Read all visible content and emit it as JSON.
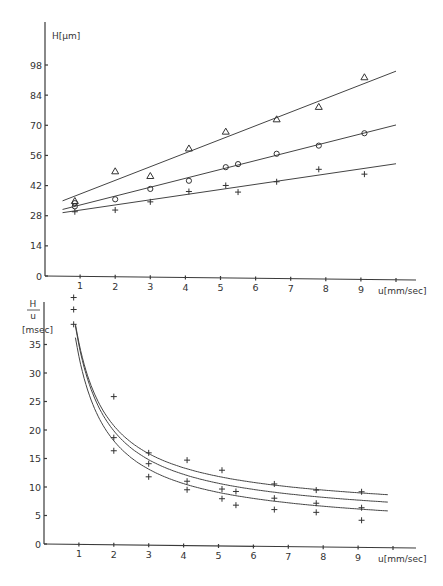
{
  "chart_data": [
    {
      "type": "scatter",
      "title": "",
      "xlabel": "u[mm/sec]",
      "ylabel": "H[µm]",
      "xlim": [
        0,
        10
      ],
      "ylim": [
        0,
        112
      ],
      "x_ticks": [
        "1",
        "2",
        "3",
        "4",
        "5",
        "6",
        "7",
        "8",
        "9"
      ],
      "y_ticks": [
        "0",
        "14",
        "28",
        "42",
        "56",
        "70",
        "84",
        "98"
      ],
      "grid": false,
      "legend": null,
      "series": [
        {
          "name": "triangle",
          "marker": "triangle",
          "x": [
            0.85,
            2.0,
            3.0,
            4.1,
            5.15,
            6.6,
            7.8,
            9.1
          ],
          "y": [
            35,
            49,
            47,
            60,
            68,
            74,
            80,
            94
          ],
          "fit_line": {
            "x": [
              0.5,
              10.0
            ],
            "y": [
              35,
              97
            ]
          }
        },
        {
          "name": "circle",
          "marker": "circle",
          "x": [
            0.85,
            0.85,
            2.0,
            3.0,
            4.1,
            5.15,
            5.5,
            6.6,
            7.8,
            9.1
          ],
          "y": [
            34,
            32.5,
            36,
            41,
            45,
            51.5,
            53,
            58,
            62,
            68
          ],
          "fit_line": {
            "x": [
              0.5,
              10.0
            ],
            "y": [
              31,
              72
            ]
          }
        },
        {
          "name": "plus",
          "marker": "plus",
          "x": [
            0.85,
            2.0,
            3.0,
            4.1,
            5.15,
            5.5,
            6.6,
            7.8,
            9.1
          ],
          "y": [
            30,
            31,
            35,
            40,
            43,
            40,
            45,
            51,
            49
          ],
          "fit_line": {
            "x": [
              0.5,
              10.0
            ],
            "y": [
              29.5,
              54
            ]
          }
        }
      ]
    },
    {
      "type": "scatter",
      "title": "",
      "xlabel": "u[mm/sec]",
      "ylabel": "H/u [msec]",
      "ylabel_numerator": "H",
      "ylabel_denominator": "u",
      "ylabel_unit": "[msec]",
      "xlim": [
        0,
        10
      ],
      "ylim": [
        0,
        40
      ],
      "x_ticks": [
        "1",
        "2",
        "3",
        "4",
        "5",
        "6",
        "7",
        "8",
        "9"
      ],
      "y_ticks": [
        "0",
        "5",
        "10",
        "15",
        "20",
        "25",
        "30",
        "35"
      ],
      "grid": false,
      "legend": null,
      "series": [
        {
          "name": "upper",
          "marker": "plus",
          "x": [
            0.85,
            2.0,
            3.0,
            4.1,
            5.1,
            6.6,
            7.8,
            9.1
          ],
          "y": [
            43.3,
            26,
            16.2,
            15,
            13.3,
            11,
            10,
            9.8
          ],
          "fit_curve": "hyperbolic",
          "fit_params": {
            "a": 6.4,
            "b": 29
          }
        },
        {
          "name": "middle",
          "marker": "plus",
          "x": [
            0.85,
            2.0,
            3.0,
            4.1,
            5.1,
            5.5,
            6.6,
            7.8,
            9.1
          ],
          "y": [
            41.2,
            18.8,
            14.3,
            11.3,
            10,
            9.6,
            8.5,
            7.7,
            7
          ],
          "fit_curve": "hyperbolic",
          "fit_params": {
            "a": 5.0,
            "b": 30
          }
        },
        {
          "name": "lower",
          "marker": "plus",
          "x": [
            0.85,
            2.0,
            3.0,
            4.1,
            5.1,
            5.5,
            6.6,
            7.8,
            9.1
          ],
          "y": [
            38.6,
            16.5,
            12,
            9.8,
            8.3,
            7.2,
            6.5,
            6.1,
            4.8
          ],
          "fit_curve": "hyperbolic",
          "fit_params": {
            "a": 3.5,
            "b": 29.5
          }
        }
      ]
    }
  ],
  "labels": {
    "top_ylabel": "H[µm]",
    "top_xlabel": "u[mm/sec]",
    "bottom_ylabel_num": "H",
    "bottom_ylabel_den": "u",
    "bottom_ylabel_unit": "[msec]",
    "bottom_xlabel": "u[mm/sec]"
  }
}
